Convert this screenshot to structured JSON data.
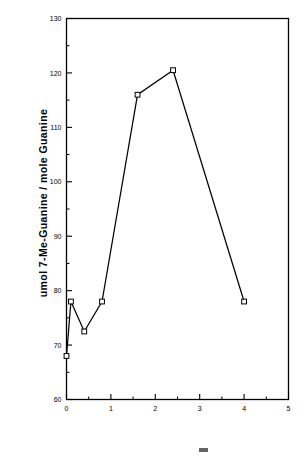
{
  "chart_data": {
    "type": "line",
    "title": "",
    "subtitle": "",
    "xlabel": "",
    "ylabel": "umol  7-Me-Guanine  /  mole  Guanine",
    "xlim": [
      0,
      5
    ],
    "ylim": [
      60,
      130
    ],
    "x_major_ticks": [
      0,
      1,
      2,
      3,
      4,
      5
    ],
    "x_tick_labels": [
      "0",
      "1",
      "2",
      "3",
      "4",
      "5"
    ],
    "x_minor_ticks": [
      0.5,
      1.5,
      2.5,
      3.5,
      4.5
    ],
    "y_major_ticks": [
      60,
      70,
      80,
      90,
      100,
      110,
      120,
      130
    ],
    "y_tick_labels": [
      "60",
      "70",
      "80",
      "90",
      "100",
      "110",
      "120",
      "130"
    ],
    "y_minor_ticks": [
      65,
      75,
      85,
      95,
      105,
      115,
      125
    ],
    "grid": false,
    "legend": false,
    "marker": "open-square",
    "line_color": "#000000",
    "marker_face_color": "#ffffff",
    "marker_edge_color": "#000000",
    "series": [
      {
        "name": "7-Me-Guanine",
        "points": [
          {
            "x": 0.0,
            "y": 68.0
          },
          {
            "x": 0.1,
            "y": 78.0
          },
          {
            "x": 0.4,
            "y": 72.5
          },
          {
            "x": 0.8,
            "y": 78.0
          },
          {
            "x": 1.6,
            "y": 116.0
          },
          {
            "x": 2.4,
            "y": 120.5
          },
          {
            "x": 4.0,
            "y": 78.0
          }
        ]
      }
    ]
  },
  "figure": {
    "background_color": "#ffffff",
    "axis_color": "#000000",
    "border": true
  }
}
